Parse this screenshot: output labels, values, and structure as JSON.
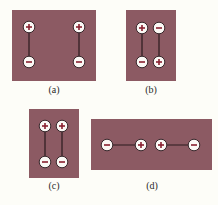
{
  "figure": {
    "colors": {
      "background": "#fdfdf8",
      "panel": "#8c5a63",
      "charge_fill": "#fbf8f5",
      "charge_outline": "#3a2a2e",
      "charge_sign": "#8a2030",
      "bond": "#2a1a1e"
    },
    "panels": [
      {
        "id": "a",
        "label": "(a)",
        "rect": [
          12,
          10,
          84,
          71
        ],
        "label_pos": [
          54,
          84
        ],
        "charges": [
          {
            "x": 29,
            "y": 27,
            "sign": "+"
          },
          {
            "x": 29,
            "y": 62,
            "sign": "−"
          },
          {
            "x": 79,
            "y": 27,
            "sign": "+"
          },
          {
            "x": 79,
            "y": 62,
            "sign": "−"
          }
        ],
        "bonds": [
          [
            0,
            1
          ],
          [
            2,
            3
          ]
        ]
      },
      {
        "id": "b",
        "label": "(b)",
        "rect": [
          126,
          10,
          50,
          71
        ],
        "label_pos": [
          151,
          84
        ],
        "charges": [
          {
            "x": 142,
            "y": 28,
            "sign": "+"
          },
          {
            "x": 142,
            "y": 62,
            "sign": "−"
          },
          {
            "x": 159,
            "y": 28,
            "sign": "−"
          },
          {
            "x": 159,
            "y": 62,
            "sign": "+"
          }
        ],
        "bonds": [
          [
            0,
            1
          ],
          [
            2,
            3
          ]
        ]
      },
      {
        "id": "c",
        "label": "(c)",
        "rect": [
          29,
          109,
          50,
          69
        ],
        "label_pos": [
          54,
          180
        ],
        "charges": [
          {
            "x": 45,
            "y": 126,
            "sign": "+"
          },
          {
            "x": 45,
            "y": 162,
            "sign": "−"
          },
          {
            "x": 62,
            "y": 126,
            "sign": "+"
          },
          {
            "x": 62,
            "y": 162,
            "sign": "−"
          }
        ],
        "bonds": [
          [
            0,
            1
          ],
          [
            2,
            3
          ]
        ]
      },
      {
        "id": "d",
        "label": "(d)",
        "rect": [
          91,
          119,
          121,
          51
        ],
        "label_pos": [
          152,
          180
        ],
        "charges": [
          {
            "x": 107,
            "y": 145,
            "sign": "−"
          },
          {
            "x": 141,
            "y": 145,
            "sign": "+"
          },
          {
            "x": 161,
            "y": 145,
            "sign": "+"
          },
          {
            "x": 194,
            "y": 145,
            "sign": "−"
          }
        ],
        "bonds": [
          [
            0,
            1
          ],
          [
            2,
            3
          ]
        ]
      }
    ]
  }
}
